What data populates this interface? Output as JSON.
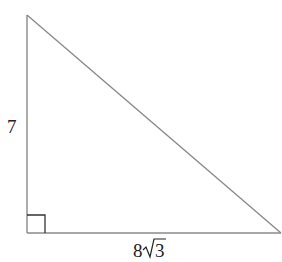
{
  "figure": {
    "type": "right-triangle",
    "legs": {
      "vertical": {
        "label": "7"
      },
      "horizontal": {
        "label_coefficient": "8",
        "label_radical": "3"
      }
    },
    "right_angle_marker": true,
    "colors": {
      "edge": "#8a8a8a",
      "marker": "#333333",
      "text": "#222222"
    }
  }
}
